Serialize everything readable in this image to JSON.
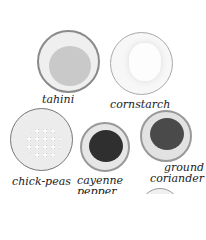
{
  "ingredients": [
    {
      "label": "tahini"
    },
    {
      "label": "cornstarch"
    },
    {
      "label": "chick-peas"
    },
    {
      "label": "cayenne pepper",
      "line1": "cayenne",
      "line2": "pepper"
    },
    {
      "label": "ground coriander",
      "line1": "ground",
      "line2": "coriander"
    }
  ],
  "colors": {
    "bowl_rim": "#8a8a8a",
    "tahini": "#c9c9c9",
    "cornstarch": "#f3f3f3",
    "chickpeas": "#e8e8e8",
    "cayenne": "#2f2f2f",
    "coriander": "#4a4a4a"
  }
}
